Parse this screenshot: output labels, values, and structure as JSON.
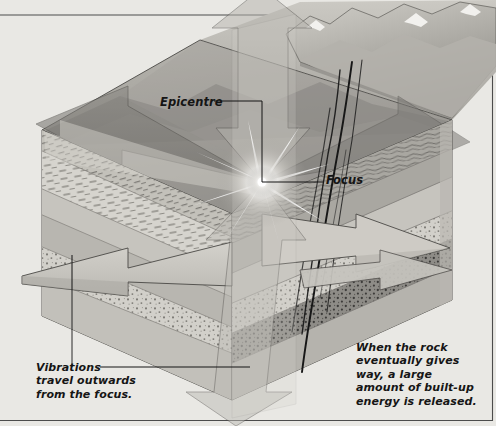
{
  "illustration": {
    "title": "Earthquake cross-section diagram",
    "subject": "Block diagram of crustal rock layers showing an earthquake focus, epicentre and outward-travelling vibration arrows",
    "background_color": "#e9e8e4"
  },
  "labels": {
    "epicentre": "Epicentre",
    "focus": "Focus",
    "vibrations": "Vibrations\ntravel outwards\nfrom the focus.",
    "caption": "When the rock\neventually gives\nway, a large\namount of built-up\nenergy is released."
  },
  "features": {
    "focus_point": {
      "x": 262,
      "y": 182,
      "name": "focus-starburst"
    },
    "epicentre_point": {
      "x": 262,
      "y": 103,
      "name": "epicentre-point"
    },
    "fault_cracks": 4,
    "vibration_arrows": 8,
    "rock_layer_count": 6
  },
  "colors": {
    "background": "#e9e8e4",
    "rock_light": "#cfcdc7",
    "rock_mid": "#b3b1ab",
    "rock_dark": "#8d8b86",
    "rock_darkest": "#6e6c68",
    "arrow_light": "#c9c7c1",
    "arrow_dark": "#7f7d79",
    "outline": "#3b3b3b",
    "snow": "#f2f1ee",
    "crack": "#1c1c1c",
    "text": "#151515"
  }
}
